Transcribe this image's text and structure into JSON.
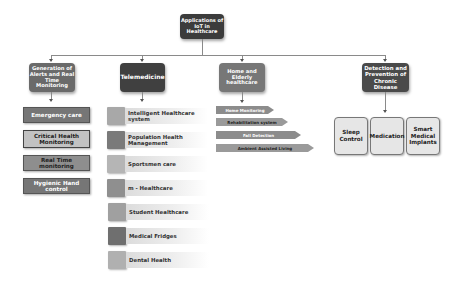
{
  "root": {
    "label": "Applications of IoT in Healthcare"
  },
  "categories": [
    {
      "label": "Generation of Alerts and Real Time Monitoring",
      "items": [
        "Emergency care",
        "Critical Health Monitoring",
        "Real Time monitoring",
        "Hygienic Hand control"
      ]
    },
    {
      "label": "Telemedicine",
      "items": [
        "Intelligent Healthcare system",
        "Population Health Management",
        "Sportsmen care",
        "m - Healthcare",
        "Student Healthcare",
        "Medical Fridges",
        "Dental Health"
      ]
    },
    {
      "label": "Home and Elderly healthcare",
      "items": [
        "Home Monitoring",
        "Rehabilitation system",
        "Fall Detection",
        "Ambient Assisted Living"
      ]
    },
    {
      "label": "Detection and Prevention of Chronic Disease",
      "items": [
        "Sleep Control",
        "Medication",
        "Smart Medical Implants"
      ]
    }
  ],
  "colors": {
    "root": "#3c3c3c",
    "connector": "#8a8a8a",
    "tele_squares": [
      "#a8a8a8",
      "#7a7a7a",
      "#b5b5b5",
      "#8f8f8f",
      "#a0a0a0",
      "#6f6f6f",
      "#b0b0b0"
    ]
  }
}
